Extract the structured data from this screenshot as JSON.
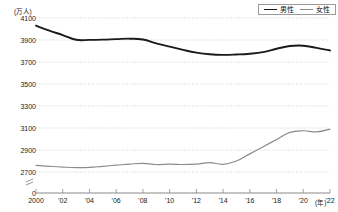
{
  "chart_data": {
    "type": "line",
    "title": "",
    "subtitle": "",
    "xlabel": "(年)",
    "ylabel": "(万人)",
    "unit_y": "(万人)",
    "unit_x": "(年)",
    "grid": true,
    "legend_position": "top-right",
    "axis_break": true,
    "ylim": [
      2700,
      4100
    ],
    "ytick_labels": [
      "4100",
      "3900",
      "3700",
      "3500",
      "3300",
      "3100",
      "2900",
      "2700",
      "0"
    ],
    "yticks": [
      4100,
      3900,
      3700,
      3500,
      3300,
      3100,
      2900,
      2700
    ],
    "zero_tick_label": "0",
    "x": [
      2000,
      2001,
      2002,
      2003,
      2004,
      2005,
      2006,
      2007,
      2008,
      2009,
      2010,
      2011,
      2012,
      2013,
      2014,
      2015,
      2016,
      2017,
      2018,
      2019,
      2020,
      2021,
      2022
    ],
    "xtick_values": [
      2000,
      2002,
      2004,
      2006,
      2008,
      2010,
      2012,
      2014,
      2016,
      2018,
      2020,
      2022
    ],
    "xtick_labels": [
      "2000",
      "'02",
      "'04",
      "'06",
      "'08",
      "'10",
      "'12",
      "'14",
      "'16",
      "'18",
      "'20",
      "'22"
    ],
    "series": [
      {
        "name": "男性",
        "color": "#1a1a1a",
        "values": [
          4030,
          3985,
          3945,
          3902,
          3901,
          3903,
          3908,
          3912,
          3905,
          3870,
          3840,
          3810,
          3785,
          3770,
          3765,
          3768,
          3775,
          3790,
          3820,
          3845,
          3848,
          3828,
          3805
        ]
      },
      {
        "name": "女性",
        "color": "#8c8c8c",
        "values": [
          2760,
          2752,
          2745,
          2740,
          2742,
          2752,
          2762,
          2772,
          2778,
          2768,
          2772,
          2768,
          2772,
          2785,
          2770,
          2800,
          2865,
          2930,
          2995,
          3060,
          3075,
          3065,
          3090
        ]
      }
    ]
  },
  "legend": {
    "items": [
      {
        "label": "男性",
        "color": "#1a1a1a"
      },
      {
        "label": "女性",
        "color": "#8c8c8c"
      }
    ]
  }
}
